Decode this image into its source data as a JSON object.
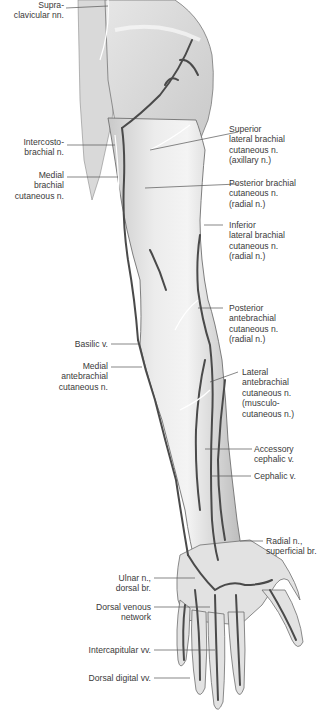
{
  "figure": {
    "colors": {
      "skin_fill": "#e9e9e9",
      "skin_shade": "#c4c4c4",
      "outline": "#6a6a6a",
      "vein": "#4a4a4a",
      "nerve": "#ffffff",
      "leader_line": "#555555",
      "label_text": "#3a3a3a"
    }
  },
  "labels_left": [
    {
      "id": "supraclavicular",
      "lines": [
        "Supra-",
        "clavicular nn."
      ]
    },
    {
      "id": "intercostobrachial",
      "lines": [
        "Intercosto-",
        "brachial n."
      ]
    },
    {
      "id": "medial-brachial",
      "lines": [
        "Medial",
        "brachial",
        "cutaneous n."
      ]
    },
    {
      "id": "basilic",
      "lines": [
        "Basilic v."
      ]
    },
    {
      "id": "medial-antebrachial",
      "lines": [
        "Medial",
        "antebrachial",
        "cutaneous n."
      ]
    },
    {
      "id": "ulnar-dorsal",
      "lines": [
        "Ulnar n.,",
        "dorsal br."
      ]
    },
    {
      "id": "dorsal-venous-network",
      "lines": [
        "Dorsal venous",
        "network"
      ]
    },
    {
      "id": "intercapitular",
      "lines": [
        "Intercapitular vv."
      ]
    },
    {
      "id": "dorsal-digital",
      "lines": [
        "Dorsal digital vv."
      ]
    }
  ],
  "labels_right": [
    {
      "id": "superior-lateral-brachial",
      "lines": [
        "Superior",
        "lateral brachial",
        "cutaneous n.",
        "(axillary n.)"
      ]
    },
    {
      "id": "posterior-brachial",
      "lines": [
        "Posterior brachial",
        "cutaneous n.",
        "(radial n.)"
      ]
    },
    {
      "id": "inferior-lateral-brachial",
      "lines": [
        "Inferior",
        "lateral brachial",
        "cutaneous n.",
        "(radial n.)"
      ]
    },
    {
      "id": "posterior-antebrachial",
      "lines": [
        "Posterior",
        "antebrachial",
        "cutaneous n.",
        "(radial n.)"
      ]
    },
    {
      "id": "lateral-antebrachial",
      "lines": [
        "Lateral",
        "antebrachial",
        "cutaneous n.",
        "(musculo-",
        "cutaneous n.)"
      ]
    },
    {
      "id": "accessory-cephalic",
      "lines": [
        "Accessory",
        "cephalic v."
      ]
    },
    {
      "id": "cephalic",
      "lines": [
        "Cephalic v."
      ]
    },
    {
      "id": "radial-superficial",
      "lines": [
        "Radial n.,",
        "superficial br."
      ]
    }
  ]
}
